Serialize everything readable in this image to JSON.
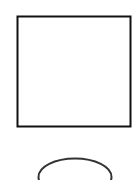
{
  "diagram": {
    "background": "#ffffff",
    "shapes": [
      {
        "kind": "rectangle",
        "x": 17.5,
        "y": 16.5,
        "width": 113,
        "height": 110,
        "stroke": "#111111",
        "stroke_width": 2,
        "fill": "#ffffff"
      },
      {
        "kind": "ellipse",
        "cx": 75,
        "cy": 177,
        "rx": 36.5,
        "ry": 18.5,
        "stroke": "#333333",
        "stroke_width": 2,
        "fill": "none"
      }
    ]
  }
}
